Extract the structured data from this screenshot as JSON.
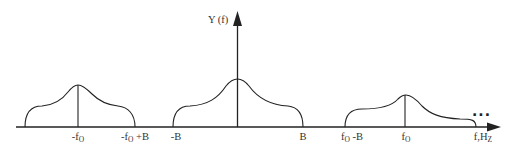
{
  "diagram": {
    "title": "",
    "y_axis_label": "Y (f)",
    "x_axis_unit_label": "f,Hz",
    "continuation": "...",
    "colors": {
      "stroke": "#222222",
      "text": "#333333",
      "background": "#ffffff"
    },
    "tick_labels": {
      "neg_fo": {
        "main": "-f",
        "sub": "O",
        "suffix": ""
      },
      "neg_fo_plus_b": {
        "main": "-f",
        "sub": "O",
        "suffix": " +B"
      },
      "neg_b": {
        "main": "-B",
        "sub": "",
        "suffix": ""
      },
      "pos_b": {
        "main": "B",
        "sub": "",
        "suffix": ""
      },
      "fo_minus_b": {
        "main": "f",
        "sub": "O",
        "suffix": " -B"
      },
      "fo": {
        "main": "f",
        "sub": "O",
        "suffix": ""
      },
      "f_hz": {
        "main": "f,H",
        "sub": "Z",
        "suffix": ""
      }
    },
    "lobes": [
      {
        "name": "negative-carrier-lobe",
        "center": "-f_O",
        "span": [
          "-f_O - B",
          "-f_O + B"
        ]
      },
      {
        "name": "baseband-lobe",
        "center": "0",
        "span": [
          "-B",
          "B"
        ]
      },
      {
        "name": "positive-carrier-lobe",
        "center": "f_O",
        "span": [
          "f_O - B",
          "f_O + B"
        ]
      }
    ]
  }
}
